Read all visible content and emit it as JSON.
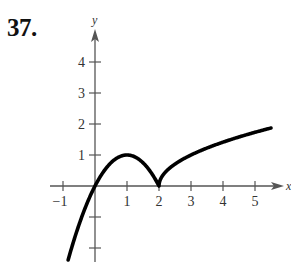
{
  "problem": {
    "number": "37."
  },
  "chart_data": {
    "type": "line",
    "title": "",
    "xlabel": "x",
    "ylabel": "y",
    "xlim": [
      -1.2,
      5.9
    ],
    "ylim": [
      -2.5,
      5.0
    ],
    "x_ticks": [
      -1,
      1,
      2,
      3,
      4,
      5
    ],
    "x_tick_labels": [
      "−1",
      "1",
      "2",
      "3",
      "4",
      "5"
    ],
    "y_ticks": [
      -2,
      -1,
      1,
      2,
      3,
      4
    ],
    "y_tick_labels": [
      "",
      "",
      "1",
      "2",
      "3",
      "4"
    ],
    "grid": false,
    "legend": null,
    "series": [
      {
        "name": "f(x)",
        "description": "Piecewise: 2x − x² for x ≤ 2 (peak at (1,1)), √(x−2) for x > 2; cusp at (2,0)",
        "x": [
          -0.84,
          -0.5,
          0,
          0.5,
          1,
          1.5,
          2,
          2.1,
          2.5,
          3,
          3.5,
          4,
          4.5,
          5,
          5.5
        ],
        "y": [
          -2.39,
          -1.25,
          0,
          0.75,
          1,
          0.75,
          0,
          0.32,
          0.71,
          1.0,
          1.22,
          1.41,
          1.58,
          1.73,
          1.87
        ]
      }
    ],
    "color": "#000000",
    "axis_color": "#555555"
  }
}
